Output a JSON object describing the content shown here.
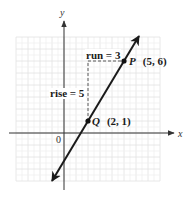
{
  "diagram": {
    "type": "coordinate-plane-slope",
    "axes": {
      "x_label": "x",
      "y_label": "y",
      "origin_label": "0"
    },
    "grid": {
      "x_range": [
        -4,
        8
      ],
      "y_range": [
        -4,
        8
      ],
      "step": 1,
      "color": "#e2e2e2"
    },
    "line": {
      "from": [
        -1,
        -4
      ],
      "to": [
        6.3,
        8.2
      ],
      "color": "#1a1a1a",
      "slope_text": "5/3"
    },
    "points": [
      {
        "name": "Q",
        "coords_text": "(2, 1)",
        "x": 2,
        "y": 1
      },
      {
        "name": "P",
        "coords_text": "(5, 6)",
        "x": 5,
        "y": 6
      }
    ],
    "annotations": {
      "run_label": "run = 3",
      "rise_label": "rise = 5"
    }
  }
}
